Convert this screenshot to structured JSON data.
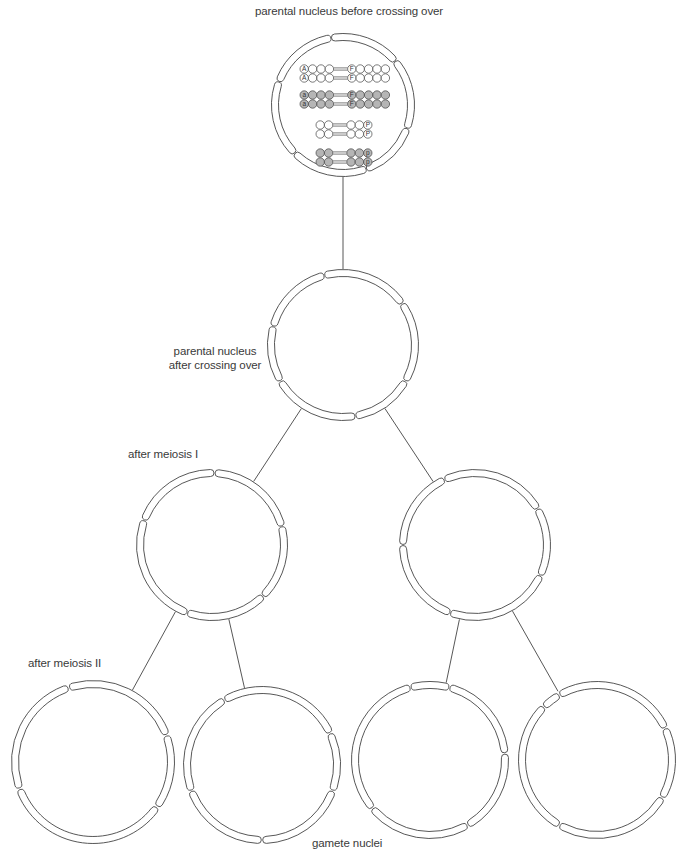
{
  "labels": {
    "top": "parental nucleus before crossing over",
    "after_crossing_line1": "parental nucleus",
    "after_crossing_line2": "after crossing over",
    "meiosis1": "after meiosis I",
    "meiosis2": "after meiosis II",
    "gametes": "gamete nuclei"
  },
  "colors": {
    "line": "#444444",
    "fill_white": "#ffffff",
    "fill_shaded": "#b5b5b5",
    "text": "#3a3a3a"
  },
  "nuclei": [
    {
      "id": "parent-before",
      "cx": 343,
      "cy": 105,
      "r": 68,
      "gaps": [
        70,
        135,
        200,
        260,
        320,
        20
      ]
    },
    {
      "id": "parent-after",
      "cx": 343,
      "cy": 345,
      "r": 72,
      "gaps": [
        255,
        325,
        30,
        80,
        150,
        195
      ]
    },
    {
      "id": "meiosis1-left",
      "cx": 212,
      "cy": 545,
      "r": 72,
      "gaps": [
        272,
        345,
        45,
        110,
        200
      ]
    },
    {
      "id": "meiosis1-right",
      "cx": 475,
      "cy": 545,
      "r": 72,
      "gaps": [
        245,
        330,
        25,
        110,
        180
      ]
    },
    {
      "id": "gamete-1",
      "cx": 93,
      "cy": 762,
      "r": 78,
      "gaps": [
        252,
        340,
        35,
        160
      ]
    },
    {
      "id": "gamete-2",
      "cx": 262,
      "cy": 765,
      "r": 75,
      "gaps": [
        240,
        335,
        20,
        90,
        160
      ]
    },
    {
      "id": "gamete-3",
      "cx": 430,
      "cy": 760,
      "r": 75,
      "gaps": [
        255,
        285,
        355,
        60,
        140
      ]
    },
    {
      "id": "gamete-4",
      "cx": 597,
      "cy": 760,
      "r": 75,
      "gaps": [
        240,
        335,
        30,
        120,
        225
      ]
    }
  ],
  "connectors": [
    {
      "from": "parent-before",
      "to": "parent-after"
    },
    {
      "from": "parent-after",
      "to": "meiosis1-left"
    },
    {
      "from": "parent-after",
      "to": "meiosis1-right"
    },
    {
      "from": "meiosis1-left",
      "to": "gamete-1"
    },
    {
      "from": "meiosis1-left",
      "to": "gamete-2"
    },
    {
      "from": "meiosis1-right",
      "to": "gamete-3"
    },
    {
      "from": "meiosis1-right",
      "to": "gamete-4"
    }
  ],
  "chromosomes": [
    {
      "y": 69,
      "x": 300,
      "shaded": false,
      "left_beads": 4,
      "right_beads": 5,
      "marker_left": "A",
      "marker_right": "F"
    },
    {
      "y": 78,
      "x": 300,
      "shaded": false,
      "left_beads": 4,
      "right_beads": 5,
      "marker_left": "A",
      "marker_right": "F"
    },
    {
      "y": 95,
      "x": 300,
      "shaded": true,
      "left_beads": 4,
      "right_beads": 5,
      "marker_left": "a",
      "marker_right": "F"
    },
    {
      "y": 104,
      "x": 300,
      "shaded": true,
      "left_beads": 4,
      "right_beads": 5,
      "marker_left": "a",
      "marker_right": "F"
    },
    {
      "y": 125,
      "x": 316,
      "shaded": false,
      "left_beads": 2,
      "right_beads": 3,
      "marker_left": "",
      "marker_right": "P"
    },
    {
      "y": 134,
      "x": 316,
      "shaded": false,
      "left_beads": 2,
      "right_beads": 3,
      "marker_left": "",
      "marker_right": "P"
    },
    {
      "y": 153,
      "x": 316,
      "shaded": true,
      "left_beads": 2,
      "right_beads": 3,
      "marker_left": "",
      "marker_right": "p"
    },
    {
      "y": 162,
      "x": 316,
      "shaded": true,
      "left_beads": 2,
      "right_beads": 3,
      "marker_left": "",
      "marker_right": "p"
    }
  ]
}
